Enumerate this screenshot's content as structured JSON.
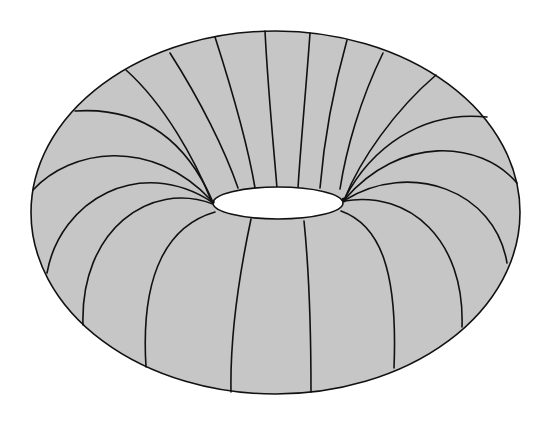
{
  "figure": {
    "title": "Torus with meridian circles",
    "shape": "torus",
    "view": "oblique from above",
    "colors": {
      "background": "#ffffff",
      "surface_fill": "#c6c6c6",
      "line": "#111111",
      "hole": "#ffffff"
    },
    "outer_silhouette": {
      "cx": 275.5,
      "cy": 212.5,
      "rx": 244.5,
      "ry": 181.5
    },
    "hole": {
      "cx": 278,
      "cy": 203,
      "rx": 65,
      "ry": 16
    },
    "meridian_count": 24
  }
}
